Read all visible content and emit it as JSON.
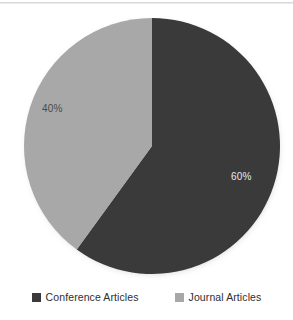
{
  "figure": {
    "background": "#ffffff",
    "width": 293,
    "height": 320
  },
  "chart_data": {
    "type": "pie",
    "title": "",
    "subtitle": "",
    "xlabel": "",
    "ylabel": "",
    "grid": false,
    "legend_position": "bottom",
    "start_angle_deg": 0,
    "direction": "clockwise",
    "center": [
      152,
      146
    ],
    "radius": 128,
    "categories": [
      "Conference Articles",
      "Journal Articles"
    ],
    "values": [
      60,
      40
    ],
    "data_labels": [
      "60%",
      "40%"
    ],
    "colors": [
      "#3a3a3a",
      "#a8a8a8"
    ],
    "slices": [
      {
        "name": "Conference Articles",
        "value": 60,
        "label": "60%",
        "color": "#3a3a3a",
        "label_color": "#e8e8e8",
        "start_deg": 0,
        "end_deg": 216
      },
      {
        "name": "Journal Articles",
        "value": 40,
        "label": "40%",
        "color": "#a8a8a8",
        "label_color": "#4a4a4a",
        "start_deg": 216,
        "end_deg": 360
      }
    ]
  },
  "labels": {
    "conference_pct": "60%",
    "journal_pct": "40%"
  },
  "legend": {
    "items": [
      {
        "label": "Conference Articles",
        "color": "#3a3a3a"
      },
      {
        "label": "Journal Articles",
        "color": "#a8a8a8"
      }
    ]
  }
}
